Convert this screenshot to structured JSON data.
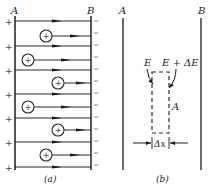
{
  "panel_a": {
    "plate_left_label": "A",
    "plate_right_label": "B",
    "caption": "(a)",
    "left_plate_sign": "+",
    "right_plate_sign": "–",
    "ion_sign": "+",
    "field_lines_y": [
      21,
      46,
      70,
      94,
      118,
      142,
      167
    ],
    "ions": [
      {
        "x": 46,
        "y": 36
      },
      {
        "x": 28,
        "y": 60
      },
      {
        "x": 58,
        "y": 83
      },
      {
        "x": 28,
        "y": 107
      },
      {
        "x": 58,
        "y": 130
      },
      {
        "x": 46,
        "y": 155
      }
    ]
  },
  "panel_b": {
    "plate_left_label": "A",
    "plate_right_label": "B",
    "caption": "(b)",
    "field_left_label": "E",
    "field_right_label": "E + ΔE",
    "area_label": "A",
    "width_label": "Δx"
  },
  "colors": {
    "line": "#2a2a2a",
    "background": "#ffffff"
  }
}
